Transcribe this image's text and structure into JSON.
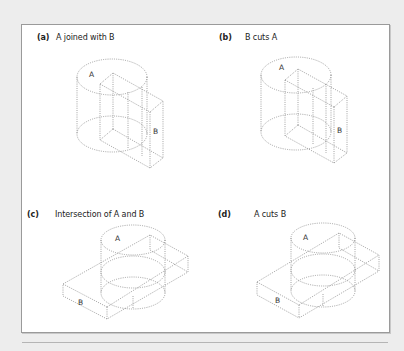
{
  "figure": {
    "panels": [
      {
        "tag": "(a)",
        "caption": "A joined with B",
        "label_a": "A",
        "label_b": "B"
      },
      {
        "tag": "(b)",
        "caption": "B cuts A",
        "label_a": "A",
        "label_b": "B"
      },
      {
        "tag": "(c)",
        "caption": "Intersection of A and B",
        "label_a": "A",
        "label_b": "B"
      },
      {
        "tag": "(d)",
        "caption": "A cuts B",
        "label_a": "A",
        "label_b": "B"
      }
    ],
    "colors": {
      "background": "#ededed",
      "panel": "#ffffff",
      "border": "#9a9a9a",
      "line": "#8c8c8c",
      "text": "#222222"
    }
  }
}
